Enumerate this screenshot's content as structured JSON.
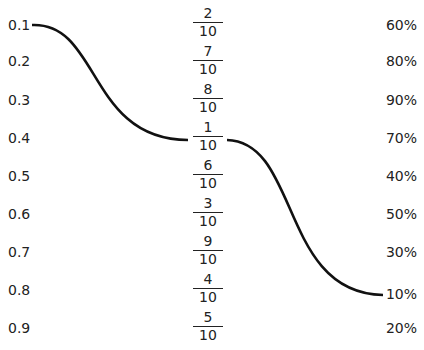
{
  "left_labels": [
    "0.1",
    "0.2",
    "0.3",
    "0.4",
    "0.5",
    "0.6",
    "0.7",
    "0.8",
    "0.9"
  ],
  "fractions": [
    {
      "num": "2",
      "den": "10"
    },
    {
      "num": "7",
      "den": "10"
    },
    {
      "num": "8",
      "den": "10"
    },
    {
      "num": "1",
      "den": "10"
    },
    {
      "num": "6",
      "den": "10"
    },
    {
      "num": "3",
      "den": "10"
    },
    {
      "num": "9",
      "den": "10"
    },
    {
      "num": "4",
      "den": "10"
    },
    {
      "num": "5",
      "den": "10"
    }
  ],
  "right_labels": [
    "60%",
    "80%",
    "90%",
    "70%",
    "40%",
    "50%",
    "30%",
    "10%",
    "20%"
  ],
  "connections": [
    {
      "from": "0.1",
      "to": "1/10"
    },
    {
      "from": "1/10",
      "to": "10%"
    }
  ]
}
